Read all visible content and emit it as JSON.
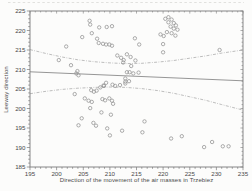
{
  "figure": {
    "background": "#fcfcfb",
    "frame_color": "#7a7a7a",
    "text_color": "#4a4a4a",
    "marker_color": "#979797",
    "regression_color": "#8a8a8a",
    "band_color": "#a8a8a8"
  },
  "chart_data": {
    "type": "scatter",
    "title": "",
    "xlabel": "Direction of the movement of the air masses in Trzebiez",
    "ylabel": "Leeway direction",
    "xlim": [
      195,
      235
    ],
    "ylim": [
      185,
      225
    ],
    "xticks": [
      195,
      200,
      205,
      210,
      215,
      220,
      225,
      230,
      235
    ],
    "yticks": [
      185,
      190,
      195,
      200,
      205,
      210,
      215,
      220,
      225
    ],
    "minor_tick_step": 1,
    "grid": false,
    "legend": null,
    "marker": "open-circle",
    "points": [
      [
        206.2,
        222.5
      ],
      [
        206.3,
        221.5
      ],
      [
        208.0,
        220.8
      ],
      [
        209.4,
        220.9
      ],
      [
        210.4,
        221.1
      ],
      [
        206.6,
        219.3
      ],
      [
        204.8,
        218.3
      ],
      [
        207.6,
        217.9
      ],
      [
        207.9,
        216.8
      ],
      [
        208.7,
        216.6
      ],
      [
        209.3,
        216.4
      ],
      [
        209.9,
        216.4
      ],
      [
        210.4,
        216.1
      ],
      [
        201.8,
        215.9
      ],
      [
        214.7,
        218.0
      ],
      [
        215.5,
        216.4
      ],
      [
        221.0,
        223.4
      ],
      [
        220.4,
        223.0
      ],
      [
        221.6,
        222.8
      ],
      [
        221.0,
        222.1
      ],
      [
        222.0,
        221.9
      ],
      [
        222.4,
        221.3
      ],
      [
        221.4,
        221.0
      ],
      [
        222.0,
        220.5
      ],
      [
        222.7,
        220.2
      ],
      [
        220.7,
        219.6
      ],
      [
        221.6,
        219.3
      ],
      [
        219.5,
        219.0
      ],
      [
        220.1,
        218.6
      ],
      [
        222.3,
        218.7
      ],
      [
        220.0,
        216.5
      ],
      [
        220.0,
        214.4
      ],
      [
        211.4,
        213.6
      ],
      [
        212.1,
        213.0
      ],
      [
        212.6,
        212.4
      ],
      [
        213.2,
        213.9
      ],
      [
        213.9,
        213.2
      ],
      [
        212.5,
        211.8
      ],
      [
        214.8,
        212.3
      ],
      [
        214.0,
        210.9
      ],
      [
        213.2,
        209.3
      ],
      [
        213.7,
        209.3
      ],
      [
        214.4,
        209.0
      ],
      [
        215.4,
        209.2
      ],
      [
        212.9,
        207.7
      ],
      [
        212.9,
        206.9
      ],
      [
        213.6,
        207.0
      ],
      [
        212.9,
        206.4
      ],
      [
        209.3,
        206.6
      ],
      [
        208.8,
        205.9
      ],
      [
        200.4,
        212.4
      ],
      [
        202.7,
        211.1
      ],
      [
        203.9,
        209.6
      ],
      [
        203.7,
        209.0
      ],
      [
        204.1,
        208.5
      ],
      [
        203.4,
        203.7
      ],
      [
        205.3,
        202.6
      ],
      [
        206.5,
        204.7
      ],
      [
        207.0,
        204.3
      ],
      [
        207.5,
        204.6
      ],
      [
        208.2,
        205.4
      ],
      [
        208.9,
        205.8
      ],
      [
        210.5,
        206.1
      ],
      [
        211.0,
        205.8
      ],
      [
        211.9,
        206.0
      ],
      [
        206.0,
        202.0
      ],
      [
        206.6,
        201.7
      ],
      [
        208.6,
        202.4
      ],
      [
        209.1,
        202.1
      ],
      [
        209.9,
        202.6
      ],
      [
        210.4,
        202.0
      ],
      [
        210.6,
        201.2
      ],
      [
        206.3,
        200.1
      ],
      [
        208.4,
        199.0
      ],
      [
        210.2,
        198.4
      ],
      [
        204.7,
        197.5
      ],
      [
        204.1,
        195.7
      ],
      [
        206.9,
        196.3
      ],
      [
        207.4,
        195.6
      ],
      [
        209.5,
        194.9
      ],
      [
        212.3,
        194.3
      ],
      [
        210.0,
        193.1
      ],
      [
        216.5,
        196.7
      ],
      [
        216.1,
        193.9
      ],
      [
        221.5,
        192.3
      ],
      [
        223.5,
        192.9
      ],
      [
        227.7,
        190.1
      ],
      [
        229.2,
        191.4
      ],
      [
        231.2,
        190.3
      ],
      [
        232.3,
        190.3
      ],
      [
        230.6,
        215.0
      ]
    ],
    "regression_line": {
      "style": "solid",
      "points": [
        [
          195,
          209.4
        ],
        [
          235,
          207.1
        ]
      ]
    },
    "confidence_bands": {
      "style": "dash-dot",
      "upper": [
        [
          195,
          215.1
        ],
        [
          198,
          214.1
        ],
        [
          201,
          213.2
        ],
        [
          204,
          212.5
        ],
        [
          207,
          212.0
        ],
        [
          210,
          211.7
        ],
        [
          213,
          211.5
        ],
        [
          216,
          211.6
        ],
        [
          219,
          211.9
        ],
        [
          222,
          212.3
        ],
        [
          225,
          212.9
        ],
        [
          228,
          213.5
        ],
        [
          231,
          214.2
        ],
        [
          235,
          215.0
        ]
      ],
      "lower": [
        [
          195,
          203.8
        ],
        [
          198,
          204.4
        ],
        [
          201,
          204.9
        ],
        [
          204,
          205.2
        ],
        [
          207,
          205.4
        ],
        [
          210,
          205.5
        ],
        [
          213,
          205.4
        ],
        [
          216,
          205.1
        ],
        [
          219,
          204.6
        ],
        [
          222,
          203.9
        ],
        [
          225,
          203.0
        ],
        [
          228,
          202.1
        ],
        [
          231,
          201.0
        ],
        [
          235,
          199.6
        ]
      ]
    }
  }
}
